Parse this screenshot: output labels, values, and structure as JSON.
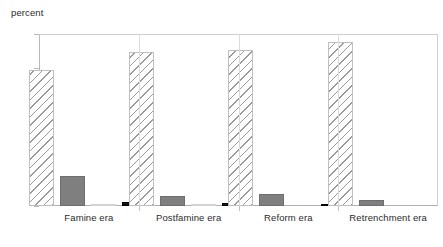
{
  "chart_data": {
    "type": "bar",
    "title": "",
    "subtitle": "",
    "xlabel": "",
    "ylabel": "percent",
    "ylim": [
      0,
      100
    ],
    "yticks": [
      0,
      20,
      40,
      60,
      80,
      100
    ],
    "ytick_labels": [
      "0",
      "20",
      "40",
      "60",
      "80",
      "100"
    ],
    "grid": false,
    "legend_position": "none",
    "categories": [
      "Famine era",
      "Postfamine era",
      "Reform era",
      "Retrenchment era"
    ],
    "series": [
      {
        "name": "series-1",
        "style": "hatched-diagonal",
        "color": "#ffffff",
        "hatch_color": "#9a9a9a",
        "values": [
          79.0,
          89.5,
          90.7,
          95.3
        ]
      },
      {
        "name": "series-2",
        "style": "solid",
        "color": "#7f7f7f",
        "values": [
          17.5,
          6.0,
          7.0,
          3.5
        ]
      },
      {
        "name": "series-3",
        "style": "solid",
        "color": "#e3e3e3",
        "values": [
          1.0,
          1.0,
          0.0,
          0.0
        ]
      },
      {
        "name": "series-4",
        "style": "solid",
        "color": "#111111",
        "values": [
          2.3,
          2.0,
          1.2,
          0.0
        ]
      }
    ]
  },
  "axis": {
    "y_title": "percent",
    "frame_color": "#b9b9b9",
    "separator_color": "#dcdcdc"
  }
}
